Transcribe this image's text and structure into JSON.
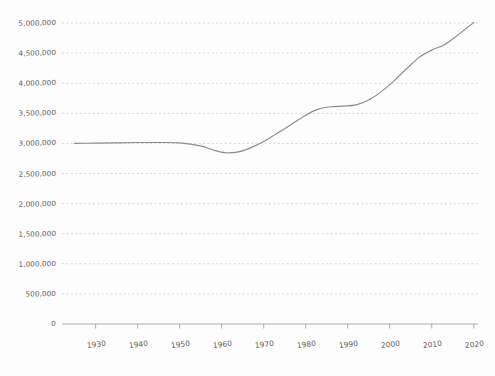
{
  "chart_data": {
    "type": "line",
    "title": "",
    "subtitle": "",
    "xlabel": "",
    "ylabel": "",
    "xlim": [
      1922,
      2021
    ],
    "ylim": [
      0,
      5150000
    ],
    "grid": true,
    "grid_axis": "y",
    "legend": false,
    "legend_position": "none",
    "line_color": "#8c8c8c",
    "grid_color": "#c9c9c9",
    "axis_color": "#9a9a9a",
    "label_color": "#5c5c5c",
    "background_color": "#fdfdfd",
    "y_ticks": [
      0,
      500000,
      1000000,
      1500000,
      2000000,
      2500000,
      3000000,
      3500000,
      4000000,
      4500000,
      5000000
    ],
    "y_tick_labels": [
      "0",
      "500,000",
      "1,000,000",
      "1,500,000",
      "2,000,000",
      "2,500,000",
      "3,000,000",
      "3,500,000",
      "4,000,000",
      "4,500,000",
      "5,000,000"
    ],
    "x_ticks": [
      1930,
      1940,
      1950,
      1960,
      1970,
      1980,
      1990,
      2000,
      2010,
      2020
    ],
    "x_tick_labels": [
      "1930",
      "1940",
      "1950",
      "1960",
      "1970",
      "1980",
      "1990",
      "2000",
      "2010",
      "2020"
    ],
    "x": [
      1925,
      1930,
      1935,
      1940,
      1945,
      1950,
      1955,
      1958,
      1961,
      1964,
      1967,
      1970,
      1973,
      1976,
      1980,
      1983,
      1986,
      1989,
      1992,
      1995,
      1998,
      2001,
      2004,
      2007,
      2010,
      2013,
      2016,
      2018,
      2020
    ],
    "series": [
      {
        "name": "Population",
        "values": [
          3000000,
          3005000,
          3010000,
          3015000,
          3015000,
          3010000,
          2960000,
          2890000,
          2845000,
          2860000,
          2930000,
          3030000,
          3160000,
          3290000,
          3470000,
          3570000,
          3610000,
          3620000,
          3640000,
          3720000,
          3860000,
          4040000,
          4240000,
          4430000,
          4550000,
          4640000,
          4790000,
          4900000,
          5010000
        ]
      }
    ]
  }
}
